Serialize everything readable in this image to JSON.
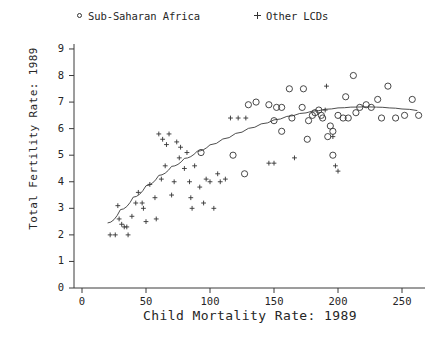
{
  "chart_data": {
    "type": "scatter",
    "title": "",
    "xlabel": "Child Mortality Rate: 1989",
    "ylabel": "Total Fertility Rate: 1989",
    "xlim": [
      0,
      268
    ],
    "ylim": [
      0,
      9.4
    ],
    "xticks": [
      0,
      50,
      100,
      150,
      200,
      250
    ],
    "xtick_labels": [
      "0",
      "50",
      "100",
      "150",
      "200",
      "250"
    ],
    "yticks": [
      0,
      1,
      2,
      3,
      4,
      5,
      6,
      7,
      8,
      9
    ],
    "ytick_labels": [
      "0",
      "1",
      "2",
      "3",
      "4",
      "5",
      "6",
      "7",
      "8",
      "9"
    ],
    "grid": false,
    "legend_position": "top",
    "axes_style": "left-and-bottom-spines-only",
    "series": [
      {
        "name": "Sub-Saharan Africa",
        "marker": "open-circle",
        "color": "#333333",
        "points": [
          [
            93,
            5.1
          ],
          [
            118,
            5.0
          ],
          [
            127,
            4.3
          ],
          [
            130,
            6.9
          ],
          [
            136,
            7.0
          ],
          [
            146,
            6.9
          ],
          [
            152,
            6.8
          ],
          [
            156,
            6.8
          ],
          [
            150,
            6.3
          ],
          [
            156,
            5.9
          ],
          [
            162,
            7.5
          ],
          [
            172,
            6.8
          ],
          [
            173,
            7.5
          ],
          [
            177,
            6.3
          ],
          [
            180,
            6.5
          ],
          [
            182,
            6.6
          ],
          [
            185,
            6.7
          ],
          [
            187,
            6.5
          ],
          [
            192,
            5.7
          ],
          [
            194,
            6.1
          ],
          [
            196,
            5.9
          ],
          [
            196,
            5.0
          ],
          [
            200,
            6.5
          ],
          [
            204,
            6.4
          ],
          [
            206,
            7.2
          ],
          [
            208,
            6.4
          ],
          [
            212,
            8.0
          ],
          [
            214,
            6.6
          ],
          [
            217,
            6.8
          ],
          [
            222,
            6.9
          ],
          [
            226,
            6.8
          ],
          [
            231,
            7.1
          ],
          [
            234,
            6.4
          ],
          [
            239,
            7.6
          ],
          [
            245,
            6.4
          ],
          [
            252,
            6.5
          ],
          [
            258,
            7.1
          ],
          [
            263,
            6.5
          ],
          [
            176,
            5.6
          ],
          [
            188,
            6.4
          ],
          [
            164,
            6.4
          ]
        ]
      },
      {
        "name": "Other LCDs",
        "marker": "plus",
        "color": "#333333",
        "points": [
          [
            22,
            2.0
          ],
          [
            26,
            2.0
          ],
          [
            29,
            2.6
          ],
          [
            31,
            2.4
          ],
          [
            28,
            3.1
          ],
          [
            33,
            2.3
          ],
          [
            35,
            2.3
          ],
          [
            36,
            2.0
          ],
          [
            39,
            2.7
          ],
          [
            42,
            3.2
          ],
          [
            44,
            3.6
          ],
          [
            48,
            3.0
          ],
          [
            50,
            2.5
          ],
          [
            53,
            3.9
          ],
          [
            57,
            3.4
          ],
          [
            58,
            2.6
          ],
          [
            62,
            4.1
          ],
          [
            65,
            4.6
          ],
          [
            66,
            5.4
          ],
          [
            68,
            5.8
          ],
          [
            70,
            3.5
          ],
          [
            72,
            4.0
          ],
          [
            74,
            5.5
          ],
          [
            76,
            4.9
          ],
          [
            77,
            5.3
          ],
          [
            80,
            4.5
          ],
          [
            82,
            5.1
          ],
          [
            84,
            4.0
          ],
          [
            85,
            3.4
          ],
          [
            86,
            3.0
          ],
          [
            88,
            4.6
          ],
          [
            92,
            3.8
          ],
          [
            95,
            3.2
          ],
          [
            97,
            4.1
          ],
          [
            100,
            4.0
          ],
          [
            103,
            3.0
          ],
          [
            106,
            4.3
          ],
          [
            108,
            4.0
          ],
          [
            112,
            4.1
          ],
          [
            116,
            6.4
          ],
          [
            122,
            6.4
          ],
          [
            128,
            6.4
          ],
          [
            146,
            4.7
          ],
          [
            150,
            4.7
          ],
          [
            166,
            4.9
          ],
          [
            190,
            6.7
          ],
          [
            191,
            7.6
          ],
          [
            196,
            5.7
          ],
          [
            198,
            4.6
          ],
          [
            200,
            4.4
          ],
          [
            60,
            5.8
          ],
          [
            63,
            5.6
          ],
          [
            47,
            3.2
          ]
        ]
      }
    ],
    "trend_line": {
      "description": "lowess smoothing curve",
      "points": [
        [
          20,
          2.45
        ],
        [
          30,
          2.95
        ],
        [
          40,
          3.42
        ],
        [
          50,
          3.85
        ],
        [
          60,
          4.24
        ],
        [
          70,
          4.58
        ],
        [
          80,
          4.88
        ],
        [
          90,
          5.15
        ],
        [
          100,
          5.39
        ],
        [
          110,
          5.61
        ],
        [
          120,
          5.82
        ],
        [
          130,
          6.01
        ],
        [
          140,
          6.18
        ],
        [
          150,
          6.33
        ],
        [
          160,
          6.46
        ],
        [
          170,
          6.57
        ],
        [
          180,
          6.66
        ],
        [
          190,
          6.73
        ],
        [
          200,
          6.78
        ],
        [
          210,
          6.81
        ],
        [
          220,
          6.82
        ],
        [
          230,
          6.81
        ],
        [
          240,
          6.78
        ],
        [
          250,
          6.74
        ],
        [
          262,
          6.68
        ]
      ]
    }
  },
  "legend": {
    "entries": [
      {
        "label": "Sub-Saharan Africa",
        "marker": "open-circle"
      },
      {
        "label": "Other LCDs",
        "marker": "plus"
      }
    ]
  },
  "axis_titles": {
    "x": "Child Mortality Rate: 1989",
    "y": "Total Fertility Rate: 1989"
  }
}
